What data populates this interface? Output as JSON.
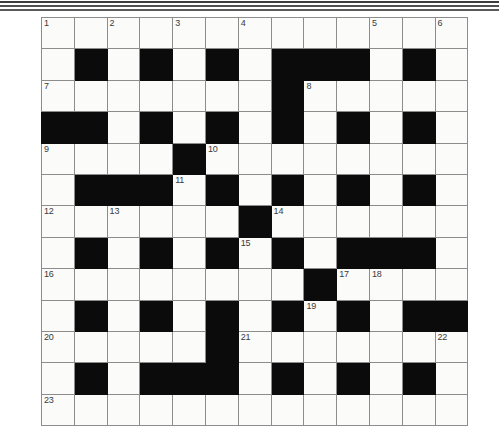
{
  "page": {
    "background_color": "#ffffff",
    "rules": [
      {
        "name": "top-rule-1"
      },
      {
        "name": "top-rule-2"
      },
      {
        "name": "top-rule-3"
      }
    ]
  },
  "crossword": {
    "name": "crossword-grid",
    "rows": 13,
    "columns": 13,
    "cell_size_px": 31.8,
    "colors": {
      "block": "#0b0b0b",
      "open": "#fbfbf9",
      "grid_line": "#8c8c8c",
      "number_text": "#3a3a3a"
    },
    "highest_clue_number": 23,
    "clue_numbers": [
      1,
      2,
      3,
      4,
      5,
      6,
      7,
      8,
      9,
      10,
      11,
      12,
      13,
      14,
      15,
      16,
      17,
      18,
      19,
      20,
      21,
      22,
      23
    ],
    "grid": [
      [
        {
          "block": false,
          "num": "1"
        },
        {
          "block": false,
          "num": ""
        },
        {
          "block": false,
          "num": "2"
        },
        {
          "block": false,
          "num": ""
        },
        {
          "block": false,
          "num": "3"
        },
        {
          "block": false,
          "num": ""
        },
        {
          "block": false,
          "num": "4"
        },
        {
          "block": false,
          "num": ""
        },
        {
          "block": false,
          "num": ""
        },
        {
          "block": false,
          "num": ""
        },
        {
          "block": false,
          "num": "5"
        },
        {
          "block": false,
          "num": ""
        },
        {
          "block": false,
          "num": "6"
        }
      ],
      [
        {
          "block": false,
          "num": ""
        },
        {
          "block": true,
          "num": ""
        },
        {
          "block": false,
          "num": ""
        },
        {
          "block": true,
          "num": ""
        },
        {
          "block": false,
          "num": ""
        },
        {
          "block": true,
          "num": ""
        },
        {
          "block": false,
          "num": ""
        },
        {
          "block": true,
          "num": ""
        },
        {
          "block": true,
          "num": ""
        },
        {
          "block": true,
          "num": ""
        },
        {
          "block": false,
          "num": ""
        },
        {
          "block": true,
          "num": ""
        },
        {
          "block": false,
          "num": ""
        }
      ],
      [
        {
          "block": false,
          "num": "7"
        },
        {
          "block": false,
          "num": ""
        },
        {
          "block": false,
          "num": ""
        },
        {
          "block": false,
          "num": ""
        },
        {
          "block": false,
          "num": ""
        },
        {
          "block": false,
          "num": ""
        },
        {
          "block": false,
          "num": ""
        },
        {
          "block": true,
          "num": ""
        },
        {
          "block": false,
          "num": "8"
        },
        {
          "block": false,
          "num": ""
        },
        {
          "block": false,
          "num": ""
        },
        {
          "block": false,
          "num": ""
        },
        {
          "block": false,
          "num": ""
        }
      ],
      [
        {
          "block": true,
          "num": ""
        },
        {
          "block": true,
          "num": ""
        },
        {
          "block": false,
          "num": ""
        },
        {
          "block": true,
          "num": ""
        },
        {
          "block": false,
          "num": ""
        },
        {
          "block": true,
          "num": ""
        },
        {
          "block": false,
          "num": ""
        },
        {
          "block": true,
          "num": ""
        },
        {
          "block": false,
          "num": ""
        },
        {
          "block": true,
          "num": ""
        },
        {
          "block": false,
          "num": ""
        },
        {
          "block": true,
          "num": ""
        },
        {
          "block": false,
          "num": ""
        }
      ],
      [
        {
          "block": false,
          "num": "9"
        },
        {
          "block": false,
          "num": ""
        },
        {
          "block": false,
          "num": ""
        },
        {
          "block": false,
          "num": ""
        },
        {
          "block": true,
          "num": ""
        },
        {
          "block": false,
          "num": "10"
        },
        {
          "block": false,
          "num": ""
        },
        {
          "block": false,
          "num": ""
        },
        {
          "block": false,
          "num": ""
        },
        {
          "block": false,
          "num": ""
        },
        {
          "block": false,
          "num": ""
        },
        {
          "block": false,
          "num": ""
        },
        {
          "block": false,
          "num": ""
        }
      ],
      [
        {
          "block": false,
          "num": ""
        },
        {
          "block": true,
          "num": ""
        },
        {
          "block": true,
          "num": ""
        },
        {
          "block": true,
          "num": ""
        },
        {
          "block": false,
          "num": "11"
        },
        {
          "block": true,
          "num": ""
        },
        {
          "block": false,
          "num": ""
        },
        {
          "block": true,
          "num": ""
        },
        {
          "block": false,
          "num": ""
        },
        {
          "block": true,
          "num": ""
        },
        {
          "block": false,
          "num": ""
        },
        {
          "block": true,
          "num": ""
        },
        {
          "block": false,
          "num": ""
        }
      ],
      [
        {
          "block": false,
          "num": "12"
        },
        {
          "block": false,
          "num": ""
        },
        {
          "block": false,
          "num": "13"
        },
        {
          "block": false,
          "num": ""
        },
        {
          "block": false,
          "num": ""
        },
        {
          "block": false,
          "num": ""
        },
        {
          "block": true,
          "num": ""
        },
        {
          "block": false,
          "num": "14"
        },
        {
          "block": false,
          "num": ""
        },
        {
          "block": false,
          "num": ""
        },
        {
          "block": false,
          "num": ""
        },
        {
          "block": false,
          "num": ""
        },
        {
          "block": false,
          "num": ""
        }
      ],
      [
        {
          "block": false,
          "num": ""
        },
        {
          "block": true,
          "num": ""
        },
        {
          "block": false,
          "num": ""
        },
        {
          "block": true,
          "num": ""
        },
        {
          "block": false,
          "num": ""
        },
        {
          "block": true,
          "num": ""
        },
        {
          "block": false,
          "num": "15"
        },
        {
          "block": true,
          "num": ""
        },
        {
          "block": false,
          "num": ""
        },
        {
          "block": true,
          "num": ""
        },
        {
          "block": true,
          "num": ""
        },
        {
          "block": true,
          "num": ""
        },
        {
          "block": false,
          "num": ""
        }
      ],
      [
        {
          "block": false,
          "num": "16"
        },
        {
          "block": false,
          "num": ""
        },
        {
          "block": false,
          "num": ""
        },
        {
          "block": false,
          "num": ""
        },
        {
          "block": false,
          "num": ""
        },
        {
          "block": false,
          "num": ""
        },
        {
          "block": false,
          "num": ""
        },
        {
          "block": false,
          "num": ""
        },
        {
          "block": true,
          "num": ""
        },
        {
          "block": false,
          "num": "17"
        },
        {
          "block": false,
          "num": "18"
        },
        {
          "block": false,
          "num": ""
        },
        {
          "block": false,
          "num": ""
        }
      ],
      [
        {
          "block": false,
          "num": ""
        },
        {
          "block": true,
          "num": ""
        },
        {
          "block": false,
          "num": ""
        },
        {
          "block": true,
          "num": ""
        },
        {
          "block": false,
          "num": ""
        },
        {
          "block": true,
          "num": ""
        },
        {
          "block": false,
          "num": ""
        },
        {
          "block": true,
          "num": ""
        },
        {
          "block": false,
          "num": "19"
        },
        {
          "block": true,
          "num": ""
        },
        {
          "block": false,
          "num": ""
        },
        {
          "block": true,
          "num": ""
        },
        {
          "block": true,
          "num": ""
        }
      ],
      [
        {
          "block": false,
          "num": "20"
        },
        {
          "block": false,
          "num": ""
        },
        {
          "block": false,
          "num": ""
        },
        {
          "block": false,
          "num": ""
        },
        {
          "block": false,
          "num": ""
        },
        {
          "block": true,
          "num": ""
        },
        {
          "block": false,
          "num": "21"
        },
        {
          "block": false,
          "num": ""
        },
        {
          "block": false,
          "num": ""
        },
        {
          "block": false,
          "num": ""
        },
        {
          "block": false,
          "num": ""
        },
        {
          "block": false,
          "num": ""
        },
        {
          "block": false,
          "num": "22"
        }
      ],
      [
        {
          "block": false,
          "num": ""
        },
        {
          "block": true,
          "num": ""
        },
        {
          "block": false,
          "num": ""
        },
        {
          "block": true,
          "num": ""
        },
        {
          "block": true,
          "num": ""
        },
        {
          "block": true,
          "num": ""
        },
        {
          "block": false,
          "num": ""
        },
        {
          "block": true,
          "num": ""
        },
        {
          "block": false,
          "num": ""
        },
        {
          "block": true,
          "num": ""
        },
        {
          "block": false,
          "num": ""
        },
        {
          "block": true,
          "num": ""
        },
        {
          "block": false,
          "num": ""
        }
      ],
      [
        {
          "block": false,
          "num": "23"
        },
        {
          "block": false,
          "num": ""
        },
        {
          "block": false,
          "num": ""
        },
        {
          "block": false,
          "num": ""
        },
        {
          "block": false,
          "num": ""
        },
        {
          "block": false,
          "num": ""
        },
        {
          "block": false,
          "num": ""
        },
        {
          "block": false,
          "num": ""
        },
        {
          "block": false,
          "num": ""
        },
        {
          "block": false,
          "num": ""
        },
        {
          "block": false,
          "num": ""
        },
        {
          "block": false,
          "num": ""
        },
        {
          "block": false,
          "num": ""
        }
      ]
    ]
  }
}
